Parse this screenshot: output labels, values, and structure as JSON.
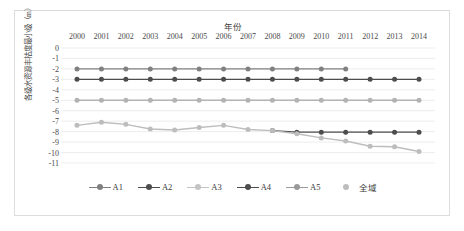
{
  "chart_data": {
    "type": "line",
    "title": "年份",
    "xlabel": "年份",
    "ylabel": "各级水资源丰枯度最小级（m）",
    "x": [
      2000,
      2001,
      2002,
      2003,
      2004,
      2005,
      2006,
      2007,
      2008,
      2009,
      2010,
      2011,
      2012,
      2013,
      2014
    ],
    "xticklabels": [
      "2000",
      "2001",
      "2002",
      "2003",
      "2004",
      "2005",
      "2006",
      "2007",
      "2008",
      "2009",
      "2010",
      "2011",
      "2012",
      "2013",
      "2014"
    ],
    "yticklabels": [
      "0",
      "-1",
      "-2",
      "-3",
      "-4",
      "-5",
      "-6",
      "-7",
      "-8",
      "-9",
      "-10",
      "-11"
    ],
    "ylim": [
      -11,
      0
    ],
    "xlim": [
      2000,
      2014
    ],
    "grid": true,
    "legend_position": "bottom",
    "series": [
      {
        "name": "A1",
        "color": "#808080",
        "x": [
          2000,
          2001,
          2002,
          2003,
          2004,
          2005,
          2006,
          2007,
          2008,
          2009,
          2010,
          2011
        ],
        "values": [
          -2,
          -2,
          -2,
          -2,
          -2,
          -2,
          -2,
          -2,
          -2,
          -2,
          -2,
          -2
        ]
      },
      {
        "name": "A2",
        "color": "#4d4d4d",
        "x": [
          2000,
          2001,
          2002,
          2003,
          2004,
          2005,
          2006,
          2007,
          2008,
          2009,
          2010,
          2011,
          2012,
          2013,
          2014
        ],
        "values": [
          -3,
          -3,
          -3,
          -3,
          -3,
          -3,
          -3,
          -3,
          -3,
          -3,
          -3,
          -3,
          -3,
          -3,
          -3
        ]
      },
      {
        "name": "A3",
        "color": "#b3b3b3",
        "x": [
          2000,
          2001,
          2002,
          2003,
          2004,
          2005,
          2006,
          2007,
          2008,
          2009,
          2010,
          2011,
          2012,
          2013,
          2014
        ],
        "values": [
          -5,
          -5,
          -5,
          -5,
          -5,
          -5,
          -5,
          -5,
          -5,
          -5,
          -5,
          -5,
          -5,
          -5,
          -5
        ]
      },
      {
        "name": "A4",
        "color": "#4d4d4d",
        "x": [
          2008,
          2009,
          2010,
          2011,
          2012,
          2013,
          2014
        ],
        "values": [
          -7.9,
          -8.05,
          -8.05,
          -8.05,
          -8.05,
          -8.05,
          -8.05
        ]
      },
      {
        "name": "A5",
        "color": "#9a9a9a",
        "x": [],
        "values": []
      },
      {
        "name": "全域",
        "color": "#bdbdbd",
        "x": [
          2000,
          2001,
          2002,
          2003,
          2004,
          2005,
          2006,
          2007,
          2008,
          2009,
          2010,
          2011,
          2012,
          2013,
          2014
        ],
        "values": [
          -7.4,
          -7.1,
          -7.3,
          -7.75,
          -7.85,
          -7.6,
          -7.4,
          -7.8,
          -7.9,
          -8.2,
          -8.6,
          -8.9,
          -9.4,
          -9.45,
          -9.9
        ]
      }
    ]
  },
  "legend": {
    "items": [
      {
        "label": "A1",
        "color": "#808080"
      },
      {
        "label": "A2",
        "color": "#4d4d4d"
      },
      {
        "label": "A3",
        "color": "#c4c4c4"
      },
      {
        "label": "A4",
        "color": "#4d4d4d"
      },
      {
        "label": "A5",
        "color": "#9a9a9a"
      },
      {
        "label": "全域",
        "color": "#bdbdbd"
      }
    ]
  },
  "colors": {
    "grid": "#e8e8e8",
    "frame": "#dcdcdc",
    "text": "#4a4a4a",
    "background": "#ffffff"
  }
}
